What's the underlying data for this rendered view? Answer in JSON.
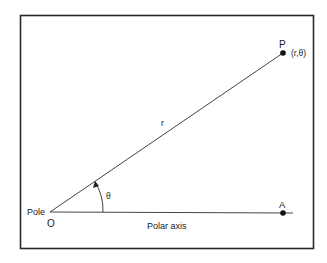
{
  "diagram": {
    "labels": {
      "point_p": "P",
      "point_p_coords": "(r,θ)",
      "radius": "r",
      "angle": "θ",
      "pole": "Pole",
      "origin": "O",
      "point_a": "A",
      "axis": "Polar axis"
    },
    "colors": {
      "line": "#333333",
      "frame": "#2a2a2a",
      "background": "#ffffff"
    }
  }
}
